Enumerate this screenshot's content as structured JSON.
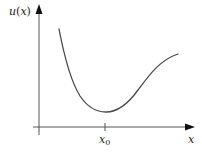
{
  "diagram": {
    "type": "function-plot",
    "y_axis": {
      "label_func": "u",
      "label_paren_open": "(",
      "label_var": "x",
      "label_paren_close": ")"
    },
    "x_axis": {
      "label": "x"
    },
    "tick": {
      "label_base": "x",
      "label_sub": "0"
    },
    "colors": {
      "axes": "#555555",
      "curve": "#4a4a4a",
      "arrow": "#111111",
      "text": "#1a1a1a"
    }
  }
}
